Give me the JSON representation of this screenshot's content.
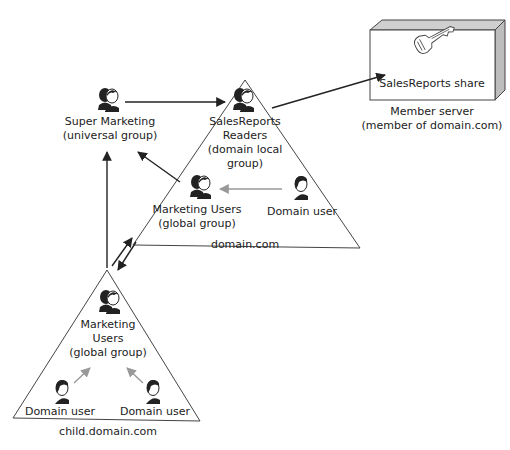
{
  "diagram": {
    "nodes": {
      "super_marketing": {
        "name": "Super Marketing",
        "type": "(universal group)"
      },
      "salesreports_readers": {
        "line1": "SalesReports",
        "line2": "Readers",
        "line3": "(domain local",
        "line4": "group)"
      },
      "marketing_users_domain": {
        "name": "Marketing Users",
        "type": "(global group)"
      },
      "domain_user_domain": {
        "name": "Domain user"
      },
      "marketing_users_child": {
        "line1": "Marketing",
        "line2": "Users",
        "line3": "(global group)"
      },
      "domain_user_child_left": {
        "name": "Domain user"
      },
      "domain_user_child_right": {
        "name": "Domain user"
      },
      "share": {
        "name": "SalesReports share"
      },
      "member_server": {
        "line1": "Member server",
        "line2": "(member of domain.com)"
      }
    },
    "domains": {
      "parent": {
        "name": "domain.com"
      },
      "child": {
        "name": "child.domain.com"
      }
    },
    "icons": {
      "group": "group-icon",
      "user": "user-icon",
      "key": "key-icon",
      "server": "server-box-icon"
    },
    "colors": {
      "line": "#222222",
      "gray_arrow": "#999999",
      "server_face": "#ffffff",
      "server_top": "#cfcfcf",
      "server_side": "#bdbdbd"
    }
  }
}
